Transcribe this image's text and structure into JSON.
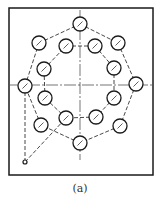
{
  "caption": "(a)",
  "colors": {
    "ink": "#1a1a1a",
    "background": "#ffffff"
  },
  "frame": {
    "x": 9,
    "y": 8,
    "width": 144,
    "height": 167
  },
  "centerlines": {
    "vertical": {
      "x": 80,
      "y1": 10,
      "y2": 160
    },
    "horizontal": {
      "y": 85,
      "x1": 10,
      "x2": 153
    }
  },
  "hole_radius": 7,
  "outer_holes": [
    {
      "x": 80,
      "y": 24
    },
    {
      "x": 118,
      "y": 43
    },
    {
      "x": 136,
      "y": 84
    },
    {
      "x": 120,
      "y": 126
    },
    {
      "x": 80,
      "y": 143
    },
    {
      "x": 41,
      "y": 125
    },
    {
      "x": 25,
      "y": 86
    },
    {
      "x": 39,
      "y": 43
    }
  ],
  "inner_holes": [
    {
      "x": 95,
      "y": 46
    },
    {
      "x": 114,
      "y": 68
    },
    {
      "x": 114,
      "y": 98
    },
    {
      "x": 96,
      "y": 117
    },
    {
      "x": 66,
      "y": 118
    },
    {
      "x": 45,
      "y": 98
    },
    {
      "x": 44,
      "y": 69
    },
    {
      "x": 66,
      "y": 46
    }
  ],
  "origin_point": {
    "x": 25,
    "y": 162,
    "r": 2
  }
}
